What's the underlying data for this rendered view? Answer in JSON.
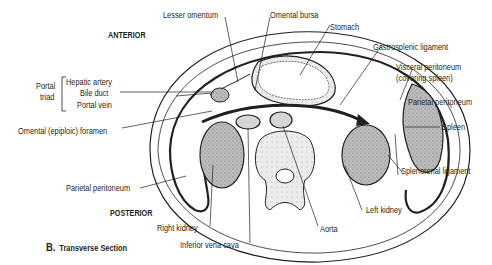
{
  "figure": {
    "caption_letter": "B.",
    "caption_text": "Transverse Section"
  },
  "orientation": {
    "anterior": "ANTERIOR",
    "posterior": "POSTERIOR"
  },
  "labels": {
    "lesser_omentum": "Lesser omentum",
    "omental_bursa": "Omental bursa",
    "stomach": "Stomach",
    "gastrosplenic_ligament": "Gastrosplenic ligament",
    "visceral_peritoneum_1": "Visceral peritoneum",
    "visceral_peritoneum_2": "(covering spleen)",
    "parietal_peritoneum_right": "Parietal peritoneum",
    "spleen": "Spleen",
    "splenorenal_ligament": "Splenorenal ligament",
    "left_kidney": "Left kidney",
    "aorta": "Aorta",
    "inferior_vena_cava": "Inferior vena cava",
    "right_kidney": "Right kidney",
    "parietal_peritoneum_left": "Parietal peritoneum",
    "omental_foramen": "Omental (epiploic) foramen",
    "portal_triad_1": "Portal",
    "portal_triad_2": "triad",
    "hepatic_artery": "Hepatic artery",
    "bile_duct": "Bile duct",
    "portal_vein": "Portal vein"
  },
  "colors": {
    "line": "#231f20",
    "organ_fill": "#b9b9b9",
    "tissue_fill": "#e3e3e3",
    "background": "#ffffff"
  }
}
